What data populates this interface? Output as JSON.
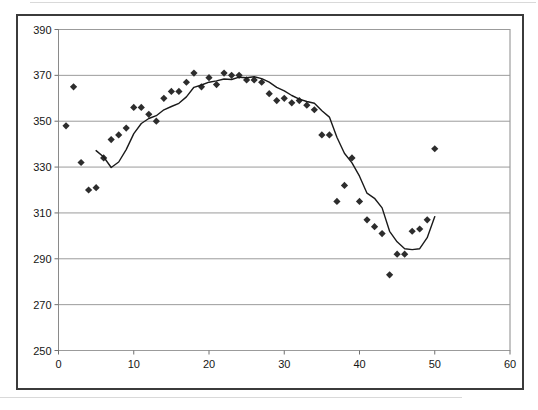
{
  "page": {
    "background_color": "#ffffff"
  },
  "chart": {
    "title": "",
    "chart_area": {
      "fill": "#ffffff",
      "border_color": "#3b3b3b",
      "border_width": 2
    },
    "plot_area": {
      "fill": "#ffffff",
      "border_color": "#8a8a8a",
      "border_width": 1
    },
    "gridline_color": "#9b9b9b",
    "tick_color": "#6f6f6f",
    "axis_label_color": "#161616",
    "axis_label_font_size": 11,
    "marker_color": "#2d2d2d",
    "line_color": "#1a1a1a"
  },
  "chart_data": {
    "type": "scatter",
    "title": "",
    "xlabel": "",
    "ylabel": "",
    "xlim": [
      0,
      60
    ],
    "ylim": [
      250,
      390
    ],
    "x_ticks": [
      0,
      10,
      20,
      30,
      40,
      50,
      60
    ],
    "y_ticks": [
      250,
      270,
      290,
      310,
      330,
      350,
      370,
      390
    ],
    "grid": "horizontal-only",
    "legend": "none",
    "series": [
      {
        "name": "observations",
        "type": "scatter",
        "marker": "diamond",
        "color": "#2d2d2d",
        "x": [
          1,
          2,
          3,
          4,
          5,
          6,
          7,
          8,
          9,
          10,
          11,
          12,
          13,
          14,
          15,
          16,
          17,
          18,
          19,
          20,
          21,
          22,
          23,
          24,
          25,
          26,
          27,
          28,
          29,
          30,
          31,
          32,
          33,
          34,
          35,
          36,
          37,
          38,
          39,
          40,
          41,
          42,
          43,
          44,
          45,
          46,
          47,
          48,
          49,
          50
        ],
        "y": [
          348,
          365,
          332,
          320,
          321,
          334,
          342,
          344,
          347,
          356,
          356,
          353,
          350,
          360,
          363,
          363,
          367,
          371,
          365,
          369,
          366,
          371,
          370,
          370,
          368,
          368,
          367,
          362,
          359,
          360,
          358,
          359,
          357,
          355,
          344,
          344,
          315,
          322,
          334,
          315,
          307,
          304,
          301,
          283,
          292,
          292,
          302,
          303,
          307,
          338
        ]
      },
      {
        "name": "moving-average-5-period",
        "type": "line",
        "color": "#1a1a1a",
        "x": [
          5,
          6,
          7,
          8,
          9,
          10,
          11,
          12,
          13,
          14,
          15,
          16,
          17,
          18,
          19,
          20,
          21,
          22,
          23,
          24,
          25,
          26,
          27,
          28,
          29,
          30,
          31,
          32,
          33,
          34,
          35,
          36,
          37,
          38,
          39,
          40,
          41,
          42,
          43,
          44,
          45,
          46,
          47,
          48,
          49,
          50
        ],
        "y": [
          337.2,
          334.4,
          329.8,
          332.2,
          337.6,
          344.6,
          349.0,
          351.2,
          352.4,
          355.0,
          356.4,
          357.8,
          360.6,
          364.8,
          365.8,
          367.0,
          367.6,
          368.4,
          368.2,
          369.2,
          369.0,
          369.4,
          368.6,
          367.0,
          364.8,
          363.2,
          361.2,
          359.6,
          358.6,
          357.8,
          354.6,
          351.8,
          343.0,
          336.0,
          331.8,
          326.0,
          318.6,
          316.4,
          312.2,
          302.0,
          297.4,
          294.4,
          294.0,
          294.4,
          299.2,
          308.4
        ]
      }
    ]
  }
}
